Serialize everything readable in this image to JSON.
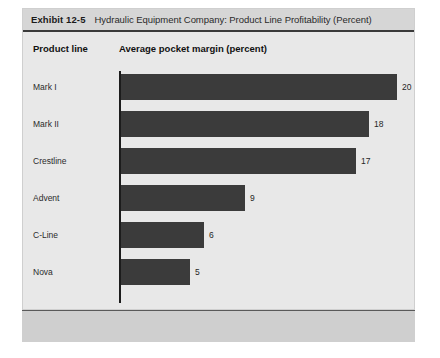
{
  "exhibit": {
    "number": "Exhibit 12-5",
    "title": "Hydraulic Equipment Company: Product Line Profitability (Percent)"
  },
  "columns": {
    "product_line": "Product line",
    "margin": "Average pocket margin (percent)"
  },
  "colors": {
    "panel_background": "#e8e8e8",
    "header_band": "#d6d6d6",
    "bar_fill": "#3b3b3b",
    "axis": "#1c1c1c",
    "footer_band": "#cfcfcf"
  },
  "chart_data": {
    "type": "bar",
    "orientation": "horizontal",
    "title": "Hydraulic Equipment Company: Product Line Profitability (Percent)",
    "xlabel": "Average pocket margin (percent)",
    "ylabel": "Product line",
    "xlim": [
      0,
      20
    ],
    "grid": false,
    "legend": false,
    "categories": [
      "Mark I",
      "Mark II",
      "Crestline",
      "Advent",
      "C-Line",
      "Nova"
    ],
    "values": [
      20,
      18,
      17,
      9,
      6,
      5
    ],
    "value_labels": [
      "20",
      "18",
      "17",
      "9",
      "6",
      "5"
    ]
  }
}
